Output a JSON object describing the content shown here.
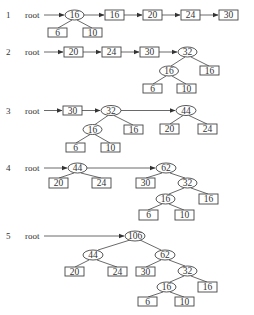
{
  "figure": {
    "steps": [
      {
        "label": "1",
        "root_text": "root",
        "root_arrow": {
          "x1": 44,
          "y1": 15,
          "x2": 64,
          "y2": 15
        },
        "nodes": [
          {
            "id": "n16",
            "kind": "ellipse",
            "text": "16",
            "x": 74.5,
            "y": 15,
            "w": 19,
            "h": 10
          },
          {
            "id": "r16",
            "kind": "box",
            "text": "16",
            "x": 105,
            "y": 10,
            "w": 19,
            "h": 10
          },
          {
            "id": "r20",
            "kind": "box",
            "text": "20",
            "x": 143,
            "y": 10,
            "w": 19,
            "h": 10
          },
          {
            "id": "r24",
            "kind": "box",
            "text": "24",
            "x": 181,
            "y": 10,
            "w": 19,
            "h": 10
          },
          {
            "id": "r30",
            "kind": "box",
            "text": "30",
            "x": 219,
            "y": 10,
            "w": 19,
            "h": 10
          },
          {
            "id": "r6",
            "kind": "box",
            "text": "6",
            "x": 48,
            "y": 28,
            "w": 19,
            "h": 9
          },
          {
            "id": "r10",
            "kind": "box",
            "text": "10",
            "x": 83,
            "y": 28,
            "w": 19,
            "h": 9
          }
        ],
        "edges": [
          {
            "x1": 72,
            "y1": 20,
            "x2": 58,
            "y2": 28
          },
          {
            "x1": 77,
            "y1": 20,
            "x2": 92,
            "y2": 28
          }
        ],
        "arrows": [
          {
            "x1": 84,
            "y1": 15,
            "x2": 104,
            "y2": 15
          },
          {
            "x1": 124,
            "y1": 15,
            "x2": 142,
            "y2": 15
          },
          {
            "x1": 162,
            "y1": 15,
            "x2": 180,
            "y2": 15
          },
          {
            "x1": 200,
            "y1": 15,
            "x2": 218,
            "y2": 15
          }
        ]
      },
      {
        "label": "2",
        "root_text": "root",
        "root_arrow": {
          "x1": 44,
          "y1": 52,
          "x2": 63,
          "y2": 52
        },
        "nodes": [
          {
            "id": "r20",
            "kind": "box",
            "text": "20",
            "x": 64,
            "y": 47,
            "w": 19,
            "h": 10
          },
          {
            "id": "r24",
            "kind": "box",
            "text": "24",
            "x": 102,
            "y": 47,
            "w": 19,
            "h": 10
          },
          {
            "id": "r30",
            "kind": "box",
            "text": "30",
            "x": 140,
            "y": 47,
            "w": 19,
            "h": 10
          },
          {
            "id": "n32",
            "kind": "ellipse",
            "text": "32",
            "x": 187.5,
            "y": 52,
            "w": 19,
            "h": 10
          },
          {
            "id": "n16",
            "kind": "ellipse",
            "text": "16",
            "x": 169,
            "y": 71,
            "w": 19,
            "h": 10
          },
          {
            "id": "r16",
            "kind": "box",
            "text": "16",
            "x": 200,
            "y": 66,
            "w": 19,
            "h": 9
          },
          {
            "id": "r6",
            "kind": "box",
            "text": "6",
            "x": 143,
            "y": 84,
            "w": 19,
            "h": 9
          },
          {
            "id": "r10",
            "kind": "box",
            "text": "10",
            "x": 177,
            "y": 84,
            "w": 19,
            "h": 9
          }
        ],
        "edges": [
          {
            "x1": 185,
            "y1": 57,
            "x2": 171,
            "y2": 66
          },
          {
            "x1": 191,
            "y1": 57,
            "x2": 209,
            "y2": 66
          },
          {
            "x1": 166,
            "y1": 76,
            "x2": 153,
            "y2": 84
          },
          {
            "x1": 172,
            "y1": 76,
            "x2": 186,
            "y2": 84
          }
        ],
        "arrows": [
          {
            "x1": 83,
            "y1": 52,
            "x2": 101,
            "y2": 52
          },
          {
            "x1": 121,
            "y1": 52,
            "x2": 139,
            "y2": 52
          },
          {
            "x1": 159,
            "y1": 52,
            "x2": 177,
            "y2": 52
          }
        ]
      },
      {
        "label": "3",
        "root_text": "root",
        "root_arrow": {
          "x1": 44,
          "y1": 110.5,
          "x2": 62,
          "y2": 110.5
        },
        "nodes": [
          {
            "id": "r30",
            "kind": "box",
            "text": "30",
            "x": 63,
            "y": 106,
            "w": 19,
            "h": 9
          },
          {
            "id": "n32",
            "kind": "ellipse",
            "text": "32",
            "x": 111,
            "y": 110.5,
            "w": 20,
            "h": 10
          },
          {
            "id": "n44",
            "kind": "ellipse",
            "text": "44",
            "x": 186,
            "y": 110.5,
            "w": 20,
            "h": 10
          },
          {
            "id": "n16",
            "kind": "ellipse",
            "text": "16",
            "x": 92.5,
            "y": 129.5,
            "w": 19,
            "h": 10
          },
          {
            "id": "r16",
            "kind": "box",
            "text": "16",
            "x": 124,
            "y": 125,
            "w": 19,
            "h": 9
          },
          {
            "id": "r20",
            "kind": "box",
            "text": "20",
            "x": 160,
            "y": 124,
            "w": 19,
            "h": 10
          },
          {
            "id": "r24",
            "kind": "box",
            "text": "24",
            "x": 198,
            "y": 124,
            "w": 19,
            "h": 10
          },
          {
            "id": "r6",
            "kind": "box",
            "text": "6",
            "x": 66,
            "y": 143,
            "w": 19,
            "h": 9
          },
          {
            "id": "r10",
            "kind": "box",
            "text": "10",
            "x": 101,
            "y": 143,
            "w": 19,
            "h": 9
          }
        ],
        "edges": [
          {
            "x1": 108,
            "y1": 115.5,
            "x2": 95,
            "y2": 124.5
          },
          {
            "x1": 114,
            "y1": 115.5,
            "x2": 133,
            "y2": 125
          },
          {
            "x1": 183,
            "y1": 115.5,
            "x2": 170,
            "y2": 124
          },
          {
            "x1": 189,
            "y1": 115.5,
            "x2": 207,
            "y2": 124
          },
          {
            "x1": 90,
            "y1": 134.5,
            "x2": 76,
            "y2": 143
          },
          {
            "x1": 95,
            "y1": 134.5,
            "x2": 110,
            "y2": 143
          }
        ],
        "arrows": [
          {
            "x1": 82,
            "y1": 110.5,
            "x2": 100,
            "y2": 110.5
          },
          {
            "x1": 121,
            "y1": 110.5,
            "x2": 175,
            "y2": 110.5
          }
        ]
      },
      {
        "label": "4",
        "root_text": "root",
        "root_arrow": {
          "x1": 44,
          "y1": 168,
          "x2": 67,
          "y2": 168
        },
        "nodes": [
          {
            "id": "n44",
            "kind": "ellipse",
            "text": "44",
            "x": 77.5,
            "y": 168,
            "w": 19,
            "h": 10
          },
          {
            "id": "n62",
            "kind": "ellipse",
            "text": "62",
            "x": 166,
            "y": 168,
            "w": 20,
            "h": 10
          },
          {
            "id": "r20",
            "kind": "box",
            "text": "20",
            "x": 49,
            "y": 178,
            "w": 19,
            "h": 10
          },
          {
            "id": "r24",
            "kind": "box",
            "text": "24",
            "x": 92,
            "y": 178,
            "w": 19,
            "h": 10
          },
          {
            "id": "r30",
            "kind": "box",
            "text": "30",
            "x": 136,
            "y": 178,
            "w": 19,
            "h": 10
          },
          {
            "id": "n32",
            "kind": "ellipse",
            "text": "32",
            "x": 187.5,
            "y": 183,
            "w": 19,
            "h": 10
          },
          {
            "id": "n16",
            "kind": "ellipse",
            "text": "16",
            "x": 165.5,
            "y": 199,
            "w": 19,
            "h": 10
          },
          {
            "id": "r16",
            "kind": "box",
            "text": "16",
            "x": 199,
            "y": 194,
            "w": 19,
            "h": 10
          },
          {
            "id": "r6",
            "kind": "box",
            "text": "6",
            "x": 139,
            "y": 210,
            "w": 19,
            "h": 10
          },
          {
            "id": "r10",
            "kind": "box",
            "text": "10",
            "x": 175,
            "y": 210,
            "w": 19,
            "h": 10
          }
        ],
        "edges": [
          {
            "x1": 74,
            "y1": 173,
            "x2": 59,
            "y2": 178
          },
          {
            "x1": 81,
            "y1": 173,
            "x2": 101,
            "y2": 178
          },
          {
            "x1": 162,
            "y1": 173,
            "x2": 146,
            "y2": 178
          },
          {
            "x1": 170,
            "y1": 173,
            "x2": 185,
            "y2": 178
          },
          {
            "x1": 184,
            "y1": 188,
            "x2": 169,
            "y2": 194
          },
          {
            "x1": 191,
            "y1": 188,
            "x2": 208,
            "y2": 194
          },
          {
            "x1": 162,
            "y1": 204,
            "x2": 148,
            "y2": 210
          },
          {
            "x1": 169,
            "y1": 204,
            "x2": 184,
            "y2": 210
          }
        ],
        "arrows": [
          {
            "x1": 87,
            "y1": 168,
            "x2": 155,
            "y2": 168
          }
        ]
      },
      {
        "label": "5",
        "root_text": "root",
        "root_arrow": {
          "x1": 44,
          "y1": 236,
          "x2": 124,
          "y2": 236
        },
        "nodes": [
          {
            "id": "n106",
            "kind": "ellipse",
            "text": "106",
            "x": 135,
            "y": 236,
            "w": 20,
            "h": 10
          },
          {
            "id": "n44",
            "kind": "ellipse",
            "text": "44",
            "x": 93,
            "y": 255,
            "w": 20,
            "h": 10
          },
          {
            "id": "n62",
            "kind": "ellipse",
            "text": "62",
            "x": 165,
            "y": 255,
            "w": 20,
            "h": 10
          },
          {
            "id": "r20",
            "kind": "box",
            "text": "20",
            "x": 65,
            "y": 267,
            "w": 19,
            "h": 9
          },
          {
            "id": "r24",
            "kind": "box",
            "text": "24",
            "x": 108,
            "y": 267,
            "w": 19,
            "h": 9
          },
          {
            "id": "r30",
            "kind": "box",
            "text": "30",
            "x": 136,
            "y": 267,
            "w": 19,
            "h": 9
          },
          {
            "id": "n32",
            "kind": "ellipse",
            "text": "32",
            "x": 187.5,
            "y": 271,
            "w": 19,
            "h": 10
          },
          {
            "id": "n16",
            "kind": "ellipse",
            "text": "16",
            "x": 166.5,
            "y": 287,
            "w": 19,
            "h": 10
          },
          {
            "id": "r16",
            "kind": "box",
            "text": "16",
            "x": 198,
            "y": 282,
            "w": 19,
            "h": 10
          },
          {
            "id": "r6",
            "kind": "box",
            "text": "6",
            "x": 138,
            "y": 297,
            "w": 19,
            "h": 9
          },
          {
            "id": "r10",
            "kind": "box",
            "text": "10",
            "x": 175,
            "y": 297,
            "w": 19,
            "h": 9
          }
        ],
        "edges": [
          {
            "x1": 130,
            "y1": 240,
            "x2": 98,
            "y2": 250
          },
          {
            "x1": 140,
            "y1": 240,
            "x2": 161,
            "y2": 250
          },
          {
            "x1": 89,
            "y1": 260,
            "x2": 75,
            "y2": 267
          },
          {
            "x1": 97,
            "y1": 260,
            "x2": 117,
            "y2": 267
          },
          {
            "x1": 161,
            "y1": 260,
            "x2": 146,
            "y2": 267
          },
          {
            "x1": 169,
            "y1": 260,
            "x2": 185,
            "y2": 266
          },
          {
            "x1": 184,
            "y1": 276,
            "x2": 170,
            "y2": 282
          },
          {
            "x1": 191,
            "y1": 276,
            "x2": 207,
            "y2": 282
          },
          {
            "x1": 163,
            "y1": 292,
            "x2": 148,
            "y2": 297
          },
          {
            "x1": 170,
            "y1": 292,
            "x2": 184,
            "y2": 297
          }
        ],
        "arrows": []
      }
    ],
    "step_label_x": 6,
    "root_label_x": 25,
    "step_label_y": [
      15,
      52,
      110.5,
      168,
      236
    ]
  }
}
